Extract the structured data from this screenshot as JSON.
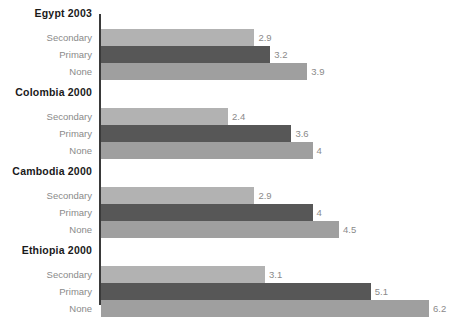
{
  "chart_data": {
    "type": "bar",
    "orientation": "horizontal",
    "title": "",
    "subtitle": "",
    "xlabel": "",
    "ylabel": "",
    "grid": false,
    "legend": "none",
    "xlim": [
      0,
      6.2
    ],
    "pixels_per_unit": 52.9,
    "series_order": [
      "Secondary",
      "Primary",
      "None"
    ],
    "series_colors": {
      "Secondary": "#b2b2b2",
      "Primary": "#575757",
      "None": "#9f9f9f"
    },
    "groups": [
      {
        "label": "Egypt 2003",
        "rows": [
          {
            "label": "Secondary",
            "value": 2.9,
            "value_text": "2.9",
            "series": "Secondary"
          },
          {
            "label": "Primary",
            "value": 3.2,
            "value_text": "3.2",
            "series": "Primary"
          },
          {
            "label": "None",
            "value": 3.9,
            "value_text": "3.9",
            "series": "None"
          }
        ]
      },
      {
        "label": "Colombia 2000",
        "rows": [
          {
            "label": "Secondary",
            "value": 2.4,
            "value_text": "2.4",
            "series": "Secondary"
          },
          {
            "label": "Primary",
            "value": 3.6,
            "value_text": "3.6",
            "series": "Primary"
          },
          {
            "label": "None",
            "value": 4.0,
            "value_text": "4",
            "series": "None"
          }
        ]
      },
      {
        "label": "Cambodia 2000",
        "rows": [
          {
            "label": "Secondary",
            "value": 2.9,
            "value_text": "2.9",
            "series": "Secondary"
          },
          {
            "label": "Primary",
            "value": 4.0,
            "value_text": "4",
            "series": "Primary"
          },
          {
            "label": "None",
            "value": 4.5,
            "value_text": "4.5",
            "series": "None"
          }
        ]
      },
      {
        "label": "Ethiopia 2000",
        "rows": [
          {
            "label": "Secondary",
            "value": 3.1,
            "value_text": "3.1",
            "series": "Secondary"
          },
          {
            "label": "Primary",
            "value": 5.1,
            "value_text": "5.1",
            "series": "Primary"
          },
          {
            "label": "None",
            "value": 6.2,
            "value_text": "6.2",
            "series": "None"
          }
        ]
      }
    ]
  },
  "axis": {
    "color": "#3a3a3a"
  }
}
